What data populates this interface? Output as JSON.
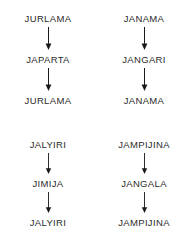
{
  "diagram": {
    "type": "derivation-chains",
    "background_color": "#ffffff",
    "text_color": "#2b2b2b",
    "arrow_color": "#1a1a1a",
    "arrow_glyph_name": "down-arrow-icon",
    "columns": 2,
    "rows": 2,
    "chains": [
      {
        "id": "chain-1",
        "position": "top-left",
        "terms": [
          "JURLAMA",
          "JAPARTA",
          "JURLAMA"
        ]
      },
      {
        "id": "chain-2",
        "position": "top-right",
        "terms": [
          "JANAMA",
          "JANGARI",
          "JANAMA"
        ]
      },
      {
        "id": "chain-3",
        "position": "bottom-left",
        "terms": [
          "JALYIRI",
          "JIMIJA",
          "JALYIRI"
        ]
      },
      {
        "id": "chain-4",
        "position": "bottom-right",
        "terms": [
          "JAMPIJINA",
          "JANGALA",
          "JAMPIJINA"
        ]
      }
    ]
  }
}
